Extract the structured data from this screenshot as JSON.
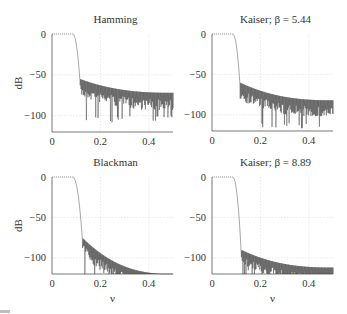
{
  "figure": {
    "panels": [
      {
        "id": "hamming",
        "title": "Hamming",
        "ylabel": "dB",
        "xlabel": ""
      },
      {
        "id": "kaiser544",
        "title": "Kaiser; β = 5.44",
        "ylabel": "",
        "xlabel": ""
      },
      {
        "id": "blackman",
        "title": "Blackman",
        "ylabel": "dB",
        "xlabel": "ν"
      },
      {
        "id": "kaiser889",
        "title": "Kaiser; β = 8.89",
        "ylabel": "",
        "xlabel": "ν"
      }
    ],
    "xticks": [
      "0",
      "0.2",
      "0.4"
    ],
    "yticks": [
      "0",
      "−50",
      "−100"
    ]
  },
  "chart_data": [
    {
      "type": "line",
      "title": "Hamming",
      "xlabel": "",
      "ylabel": "dB",
      "xlim": [
        0,
        0.5
      ],
      "ylim": [
        -120,
        5
      ],
      "grid": true,
      "x_ticks": [
        0,
        0.2,
        0.4
      ],
      "y_ticks": [
        0,
        -50,
        -100
      ],
      "passband_edge": 0.1,
      "transition_end": 0.115,
      "sidelobe_start_db": -55,
      "sidelobe_end_db": -72,
      "null_depth_db": -100,
      "description": "Lowpass FIR magnitude response, Hamming window; sidelobes decay from ~-55 dB to ~-72 dB"
    },
    {
      "type": "line",
      "title": "Kaiser; β = 5.44",
      "xlabel": "",
      "ylabel": "",
      "xlim": [
        0,
        0.5
      ],
      "ylim": [
        -120,
        5
      ],
      "grid": true,
      "x_ticks": [
        0,
        0.2,
        0.4
      ],
      "y_ticks": [
        0,
        -50,
        -100
      ],
      "passband_edge": 0.1,
      "transition_end": 0.115,
      "sidelobe_start_db": -60,
      "sidelobe_end_db": -82,
      "null_depth_db": -110,
      "description": "Lowpass FIR magnitude response, Kaiser window beta=5.44; sidelobes decay from ~-60 dB to ~-82 dB"
    },
    {
      "type": "line",
      "title": "Blackman",
      "xlabel": "ν",
      "ylabel": "dB",
      "xlim": [
        0,
        0.5
      ],
      "ylim": [
        -120,
        5
      ],
      "grid": true,
      "x_ticks": [
        0,
        0.2,
        0.4
      ],
      "y_ticks": [
        0,
        -50,
        -100
      ],
      "passband_edge": 0.1,
      "transition_end": 0.125,
      "sidelobe_start_db": -75,
      "sidelobe_end_db": -120,
      "null_depth_db": -120,
      "description": "Lowpass FIR magnitude response, Blackman window; sidelobes fall below -120 dB by ν≈0.3"
    },
    {
      "type": "line",
      "title": "Kaiser; β = 8.89",
      "xlabel": "ν",
      "ylabel": "",
      "xlim": [
        0,
        0.5
      ],
      "ylim": [
        -120,
        5
      ],
      "grid": true,
      "x_ticks": [
        0,
        0.2,
        0.4
      ],
      "y_ticks": [
        0,
        -50,
        -100
      ],
      "passband_edge": 0.1,
      "transition_end": 0.12,
      "sidelobe_start_db": -90,
      "sidelobe_end_db": -112,
      "null_depth_db": -120,
      "description": "Lowpass FIR magnitude response, Kaiser window beta=8.89; sidelobes decay from ~-90 dB to ~-112 dB"
    }
  ]
}
